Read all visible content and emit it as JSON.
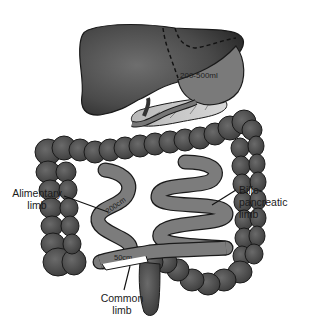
{
  "diagram": {
    "type": "anatomical-surgical-illustration",
    "organs": [
      "liver",
      "stomach (sleeve)",
      "colon",
      "small intestine"
    ],
    "labels": {
      "stomach_volume": "200-500ml",
      "alimentary_length": "200cm",
      "common_length": "50cm",
      "alimentary": [
        "Alimentary",
        "limb"
      ],
      "biliopancreatic": [
        "Bilio-",
        "pancreatic",
        "limb"
      ],
      "common": [
        "Common",
        "limb"
      ]
    },
    "colors": {
      "liver": "#4a4a4a",
      "stomach": "#7a7a7a",
      "colon": "#4d4d4d",
      "small_bowel": "#7c7c7c",
      "outline": "#1a1a1a",
      "background": "#ffffff"
    }
  }
}
